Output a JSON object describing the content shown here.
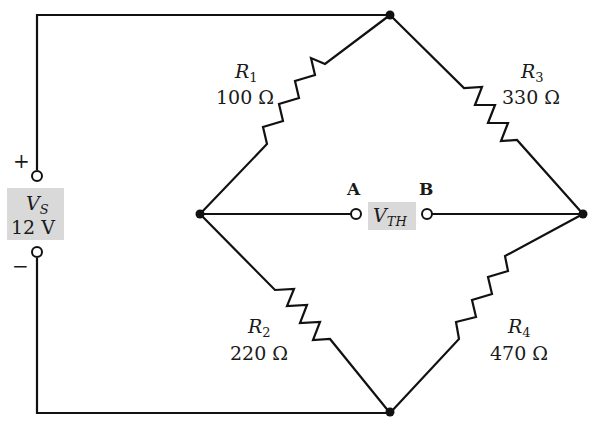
{
  "diagram": {
    "type": "Wheatstone bridge circuit",
    "source": {
      "name": "V_S",
      "name_main": "V",
      "name_sub": "S",
      "value": "12 V",
      "plus_label": "+",
      "minus_label": "−",
      "label_bg": "#d9d9d9"
    },
    "resistors": [
      {
        "id": "R1",
        "name_main": "R",
        "name_sub": "1",
        "value": "100 Ω"
      },
      {
        "id": "R2",
        "name_main": "R",
        "name_sub": "2",
        "value": "220 Ω"
      },
      {
        "id": "R3",
        "name_main": "R",
        "name_sub": "3",
        "value": "330 Ω"
      },
      {
        "id": "R4",
        "name_main": "R",
        "name_sub": "4",
        "value": "470 Ω"
      }
    ],
    "output": {
      "terminal_a": "A",
      "terminal_b": "B",
      "name_main": "V",
      "name_sub": "TH",
      "label_bg": "#d9d9d9"
    },
    "colors": {
      "wire": "#111111",
      "background": "#ffffff"
    }
  }
}
